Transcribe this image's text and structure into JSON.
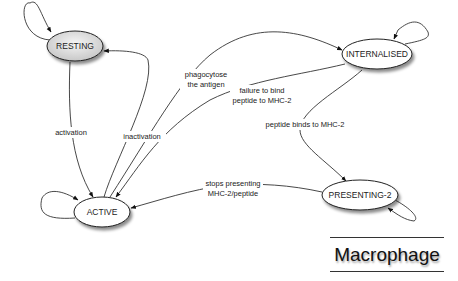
{
  "diagram": {
    "type": "state-diagram",
    "title": "Macrophage",
    "nodes": [
      {
        "id": "resting",
        "label": "RESTING",
        "fill": "#d9d9d9"
      },
      {
        "id": "active",
        "label": "ACTIVE",
        "fill": "#ffffff"
      },
      {
        "id": "internalised",
        "label": "INTERNALISED",
        "fill": "#ffffff"
      },
      {
        "id": "presenting2",
        "label": "PRESENTING-2",
        "fill": "#ffffff"
      }
    ],
    "edges": [
      {
        "from": "resting",
        "to": "resting",
        "label": ""
      },
      {
        "from": "resting",
        "to": "active",
        "label": "activation"
      },
      {
        "from": "active",
        "to": "resting",
        "label": "inactivation"
      },
      {
        "from": "active",
        "to": "active",
        "label": ""
      },
      {
        "from": "active",
        "to": "internalised",
        "label_line1": "phagocytose",
        "label_line2": "the antigen"
      },
      {
        "from": "internalised",
        "to": "active",
        "label_line1": "failure to bind",
        "label_line2": "peptide to MHC-2"
      },
      {
        "from": "internalised",
        "to": "internalised",
        "label": ""
      },
      {
        "from": "internalised",
        "to": "presenting2",
        "label": "peptide binds to MHC-2"
      },
      {
        "from": "presenting2",
        "to": "active",
        "label_line1": "stops presenting",
        "label_line2": "MHC-2/peptide"
      },
      {
        "from": "presenting2",
        "to": "presenting2",
        "label": ""
      }
    ]
  }
}
